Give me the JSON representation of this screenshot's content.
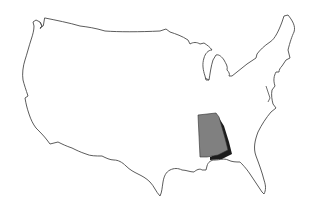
{
  "map": {
    "subject": "Contiguous United States outline",
    "highlighted_region": {
      "name": "Alabama",
      "fill_color": "#808080",
      "shadow_color": "#1c1c1c"
    },
    "outline_color": "#4a4a4a",
    "background_color": "#ffffff"
  }
}
